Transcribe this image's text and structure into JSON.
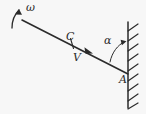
{
  "figure": {
    "type": "physics-diagram",
    "background_color": "#f7f7f7",
    "ink_color": "#2b2b2b",
    "width": 146,
    "height": 114
  },
  "labels": {
    "omega": "ω",
    "center_of_mass": "C",
    "velocity": "V",
    "angle": "α",
    "contact_point": "A"
  },
  "elements": {
    "rod": {
      "name": "rod",
      "start": [
        22,
        20
      ],
      "end": [
        128,
        74
      ]
    },
    "wall": {
      "name": "wall",
      "x": 128,
      "top": 22,
      "bottom": 108,
      "hatch_count": 9,
      "hatch_side": "right"
    },
    "omega_arrow": {
      "name": "angular-velocity-arrow",
      "direction": "counterclockwise",
      "anchor": [
        17,
        20
      ]
    },
    "velocity_arrow": {
      "name": "velocity-arrow",
      "direction": "down-right-along-rod",
      "tip": [
        92,
        53
      ]
    },
    "angle_arc": {
      "name": "angle-arc",
      "between": [
        "rod",
        "wall"
      ],
      "vertex": [
        128,
        74
      ]
    },
    "point_tick": {
      "name": "center-of-mass-tick",
      "at": [
        70,
        44
      ]
    }
  }
}
